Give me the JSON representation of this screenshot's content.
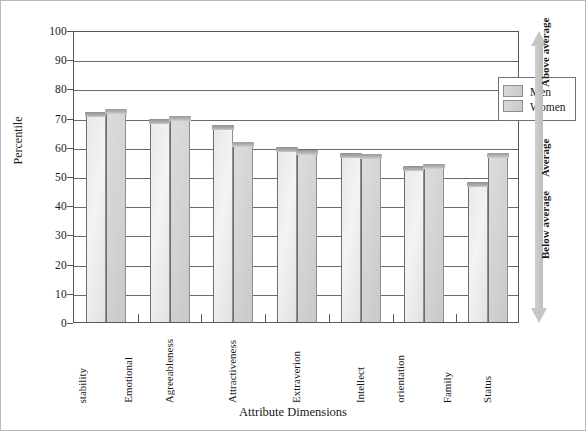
{
  "chart_data": {
    "type": "bar",
    "title": "",
    "xlabel": "Attribute Dimensions",
    "ylabel": "Percentile",
    "ylim": [
      0,
      100
    ],
    "ytick_step": 10,
    "yticks": [
      100,
      90,
      80,
      70,
      60,
      50,
      40,
      30,
      20,
      10,
      0
    ],
    "grid": true,
    "legend_position": "top-right",
    "categories": [
      "Emotional stability",
      "Agreeableness",
      "Attractiveness",
      "Extraverion",
      "Intellect",
      "Family orientation",
      "Status"
    ],
    "category_lines": [
      [
        "Emotional",
        "stability"
      ],
      [
        "Agreeableness"
      ],
      [
        "Attractiveness"
      ],
      [
        "Extraverion"
      ],
      [
        "Intellect"
      ],
      [
        "Family",
        "orientation"
      ],
      [
        "Status"
      ]
    ],
    "series": [
      {
        "name": "Men",
        "values": [
          72,
          69.5,
          67.5,
          60,
          58,
          53.5,
          48
        ]
      },
      {
        "name": "Women",
        "values": [
          73,
          70.5,
          61.5,
          59,
          57.5,
          54,
          58
        ]
      }
    ],
    "annotations": [
      {
        "text": "Above average",
        "position": "upper-right"
      },
      {
        "text": "Average",
        "position": "middle-right"
      },
      {
        "text": "Below average",
        "position": "lower-right"
      }
    ],
    "colors": {
      "men_bar": "#ececec",
      "women_bar": "#d4d4d4",
      "bar_top": "#a5a5a5",
      "axis": "#55565a",
      "grid": "#6a6b6f",
      "arrow": "#c6c6c6",
      "frame": "#b9b9b9",
      "background": "#ffffff"
    }
  },
  "legend": {
    "items": [
      "Men",
      "Women"
    ],
    "swatch_icon": "bar-swatch-icon"
  },
  "annotation_arrow": {
    "icon": "double-headed-vertical-arrow-icon",
    "above": "Above average",
    "average": "Average",
    "below": "Below average"
  }
}
